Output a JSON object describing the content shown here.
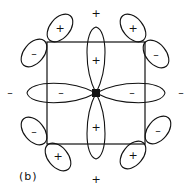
{
  "figure": {
    "label": "(b)",
    "center_atom": "metal-center",
    "outer_signs": {
      "top": "+",
      "bottom": "+",
      "left": "–",
      "right": "–"
    },
    "central_lobes": {
      "top": "+",
      "bottom": "+",
      "left": "–",
      "right": "–"
    },
    "corner_orbitals": {
      "top_left": {
        "outer": "+",
        "inner": "–"
      },
      "top_right": {
        "outer": "+",
        "inner": "–"
      },
      "bottom_left": {
        "outer": "+",
        "inner": "–"
      },
      "bottom_right": {
        "outer": "+",
        "inner": "–"
      }
    },
    "colors": {
      "stroke": "#111111",
      "background": "#ffffff"
    }
  }
}
